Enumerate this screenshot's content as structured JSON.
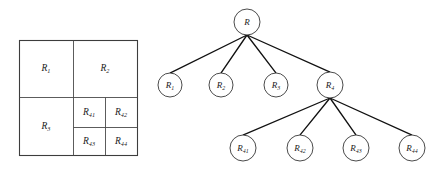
{
  "figure": {
    "background_color": "#ffffff",
    "line_color": "#3d3d3d",
    "edge_color": "#111111",
    "text_color": "#1a1a1a",
    "width": 446,
    "height": 173
  },
  "partition": {
    "name": "region-partition-diagram",
    "outer": {
      "x": 19,
      "y": 40,
      "width": 118,
      "height": 115
    },
    "dividers": {
      "vertical_main_x": 73,
      "horizontal_main_y": 97,
      "quad_vertical_x": 105,
      "quad_horizontal_y": 127
    },
    "cells": [
      {
        "id": "R1",
        "base": "R",
        "sub": "1",
        "label": "R1",
        "cx": 46,
        "cy": 68
      },
      {
        "id": "R2",
        "base": "R",
        "sub": "2",
        "label": "R2",
        "cx": 105,
        "cy": 68
      },
      {
        "id": "R3",
        "base": "R",
        "sub": "3",
        "label": "R3",
        "cx": 46,
        "cy": 126
      },
      {
        "id": "R41",
        "base": "R",
        "sub": "41",
        "label": "R41",
        "cx": 89,
        "cy": 112
      },
      {
        "id": "R42",
        "base": "R",
        "sub": "42",
        "label": "R42",
        "cx": 121,
        "cy": 112
      },
      {
        "id": "R43",
        "base": "R",
        "sub": "43",
        "label": "R43",
        "cx": 89,
        "cy": 141
      },
      {
        "id": "R44",
        "base": "R",
        "sub": "44",
        "label": "R44",
        "cx": 121,
        "cy": 141
      }
    ]
  },
  "tree": {
    "name": "quadtree-diagram",
    "nodes": [
      {
        "id": "R",
        "base": "R",
        "sub": "",
        "label": "R",
        "cx": 247,
        "cy": 22,
        "r": 13,
        "level": 0
      },
      {
        "id": "R1",
        "base": "R",
        "sub": "1",
        "label": "R1",
        "cx": 170,
        "cy": 85,
        "r": 12,
        "level": 1
      },
      {
        "id": "R2",
        "base": "R",
        "sub": "2",
        "label": "R2",
        "cx": 221,
        "cy": 85,
        "r": 12,
        "level": 1
      },
      {
        "id": "R3",
        "base": "R",
        "sub": "3",
        "label": "R3",
        "cx": 276,
        "cy": 85,
        "r": 12,
        "level": 1
      },
      {
        "id": "R4",
        "base": "R",
        "sub": "4",
        "label": "R4",
        "cx": 330,
        "cy": 85,
        "r": 13,
        "level": 1
      },
      {
        "id": "R41",
        "base": "R",
        "sub": "41",
        "label": "R41",
        "cx": 243,
        "cy": 148,
        "r": 13,
        "level": 2
      },
      {
        "id": "R42",
        "base": "R",
        "sub": "42",
        "label": "R42",
        "cx": 300,
        "cy": 148,
        "r": 13,
        "level": 2
      },
      {
        "id": "R43",
        "base": "R",
        "sub": "43",
        "label": "R43",
        "cx": 356,
        "cy": 148,
        "r": 13,
        "level": 2
      },
      {
        "id": "R44",
        "base": "R",
        "sub": "44",
        "label": "R44",
        "cx": 412,
        "cy": 148,
        "r": 13,
        "level": 2
      }
    ],
    "edges": [
      {
        "from": "R",
        "to": "R1"
      },
      {
        "from": "R",
        "to": "R2"
      },
      {
        "from": "R",
        "to": "R3"
      },
      {
        "from": "R",
        "to": "R4"
      },
      {
        "from": "R4",
        "to": "R41"
      },
      {
        "from": "R4",
        "to": "R42"
      },
      {
        "from": "R4",
        "to": "R43"
      },
      {
        "from": "R4",
        "to": "R44"
      }
    ]
  }
}
